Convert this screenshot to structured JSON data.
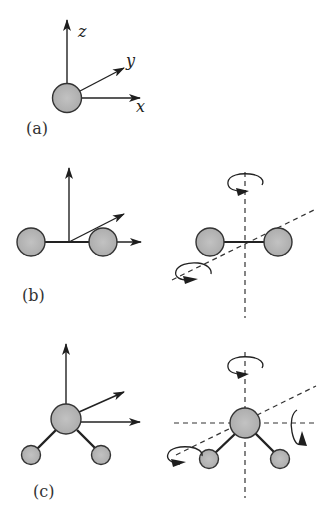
{
  "panels": {
    "a": {
      "label": "(a)",
      "axes": {
        "x": "x",
        "y": "y",
        "z": "z"
      }
    },
    "b": {
      "label": "(b)"
    },
    "c": {
      "label": "(c)"
    }
  },
  "colors": {
    "atom_fill": "#b9b9b9",
    "stroke": "#2a2a2a",
    "background": "#ffffff"
  }
}
